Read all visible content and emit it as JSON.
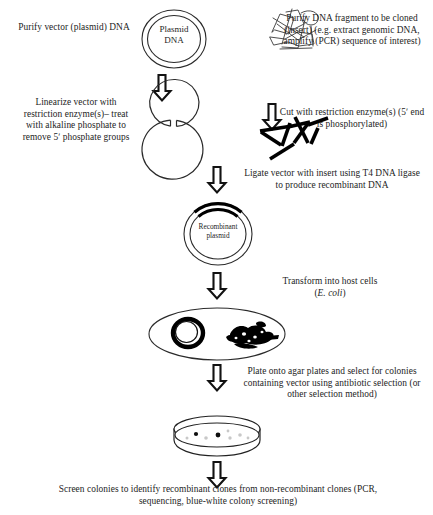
{
  "diagram": {
    "steps": {
      "purify_vector": "Purify vector (plasmid) DNA",
      "purify_insert": "Purify DNA fragment to be cloned (insert) (e.g. extract genomic DNA, amplify (PCR) sequence of interest)",
      "linearize": "Linearize vector with restriction enzyme(s)– treat with alkaline phosphate to remove 5ʹ phosphate groups",
      "cut": "Cut with restriction enzyme(s) (5ʹ end is phosphorylated)",
      "ligate": "Ligate vector with insert using T4 DNA ligase to produce recombinant DNA",
      "transform_line1": "Transform into host cells",
      "transform_organism": "E. coli",
      "transform_paren_open": "(",
      "transform_paren_close": ")",
      "plate": "Plate onto agar plates and select for colonies containing vector using antibiotic selection (or other selection method)",
      "screen": "Screen colonies to identify recombinant clones from non-recombinant clones (PCR, sequencing, blue-white colony screening)"
    },
    "figures": {
      "plasmid_label_line1": "Plasmid",
      "plasmid_label_line2": "DNA",
      "recombinant_label_line1": "Recombinant",
      "recombinant_label_line2": "plasmid"
    },
    "colors": {
      "ink": "#242424",
      "line": "#1c1c1c",
      "fill_dark": "#000000",
      "paper": "#ffffff",
      "colony_light": "#c8c8c8"
    }
  }
}
